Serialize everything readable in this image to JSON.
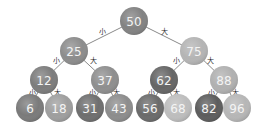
{
  "diagram": {
    "type": "binary-search-tree",
    "nodes": [
      {
        "id": "n50",
        "label": "50",
        "x": 134,
        "y": 21,
        "r": 14,
        "fill": "#828282"
      },
      {
        "id": "n25",
        "label": "25",
        "x": 74,
        "y": 51,
        "r": 14,
        "fill": "#8c8c8c"
      },
      {
        "id": "n75",
        "label": "75",
        "x": 194,
        "y": 51,
        "r": 14,
        "fill": "#b4b4b4"
      },
      {
        "id": "n12",
        "label": "12",
        "x": 44,
        "y": 80,
        "r": 14,
        "fill": "#7c7c7c"
      },
      {
        "id": "n37",
        "label": "37",
        "x": 105,
        "y": 80,
        "r": 14,
        "fill": "#8e8e8e"
      },
      {
        "id": "n62",
        "label": "62",
        "x": 164,
        "y": 80,
        "r": 14,
        "fill": "#656565"
      },
      {
        "id": "n88",
        "label": "88",
        "x": 224,
        "y": 80,
        "r": 14,
        "fill": "#b0b0b0"
      },
      {
        "id": "n6",
        "label": "6",
        "x": 30,
        "y": 108,
        "r": 14,
        "fill": "#7a7a7a"
      },
      {
        "id": "n18",
        "label": "18",
        "x": 59,
        "y": 108,
        "r": 14,
        "fill": "#9e9e9e"
      },
      {
        "id": "n31",
        "label": "31",
        "x": 90,
        "y": 108,
        "r": 14,
        "fill": "#6e6e6e"
      },
      {
        "id": "n43",
        "label": "43",
        "x": 119,
        "y": 108,
        "r": 14,
        "fill": "#8c8c8c"
      },
      {
        "id": "n56",
        "label": "56",
        "x": 150,
        "y": 108,
        "r": 14,
        "fill": "#6a6a6a"
      },
      {
        "id": "n68",
        "label": "68",
        "x": 178,
        "y": 108,
        "r": 14,
        "fill": "#bdbdbd"
      },
      {
        "id": "n82",
        "label": "82",
        "x": 209,
        "y": 108,
        "r": 14,
        "fill": "#5c5c5c"
      },
      {
        "id": "n96",
        "label": "96",
        "x": 237,
        "y": 108,
        "r": 14,
        "fill": "#b6b6b6"
      }
    ],
    "edges": [
      {
        "from": "n50",
        "to": "n25",
        "label": "小",
        "lx": 102,
        "ly": 32
      },
      {
        "from": "n50",
        "to": "n75",
        "label": "大",
        "lx": 164,
        "ly": 32
      },
      {
        "from": "n25",
        "to": "n12",
        "label": "小",
        "lx": 56,
        "ly": 61
      },
      {
        "from": "n25",
        "to": "n37",
        "label": "大",
        "lx": 93,
        "ly": 61
      },
      {
        "from": "n75",
        "to": "n62",
        "label": "小",
        "lx": 176,
        "ly": 61
      },
      {
        "from": "n75",
        "to": "n88",
        "label": "大",
        "lx": 210,
        "ly": 61
      },
      {
        "from": "n12",
        "to": "n6",
        "label": "小",
        "lx": 32,
        "ly": 93
      },
      {
        "from": "n12",
        "to": "n18",
        "label": "大",
        "lx": 57,
        "ly": 93
      },
      {
        "from": "n37",
        "to": "n31",
        "label": "小",
        "lx": 92,
        "ly": 93
      },
      {
        "from": "n37",
        "to": "n43",
        "label": "大",
        "lx": 116,
        "ly": 93
      },
      {
        "from": "n62",
        "to": "n56",
        "label": "小",
        "lx": 151,
        "ly": 93
      },
      {
        "from": "n62",
        "to": "n68",
        "label": "大",
        "lx": 176,
        "ly": 93
      },
      {
        "from": "n88",
        "to": "n82",
        "label": "小",
        "lx": 211,
        "ly": 93
      },
      {
        "from": "n88",
        "to": "n96",
        "label": "大",
        "lx": 235,
        "ly": 93
      }
    ]
  }
}
